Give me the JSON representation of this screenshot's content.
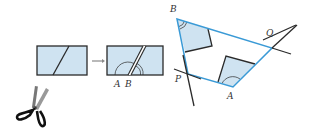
{
  "colors": {
    "fill": "#cfe3f1",
    "stroke": "#2a2a2a",
    "blue": "#3a9ad6",
    "arrow": "#8a8a8a"
  },
  "labels": {
    "rect2_A": "A",
    "rect2_B": "B",
    "quad_B": "B",
    "quad_Q": "Q",
    "quad_P": "P",
    "quad_A": "A"
  },
  "icons": {
    "scissors": "scissors-icon",
    "arrow": "arrow-right-icon"
  }
}
